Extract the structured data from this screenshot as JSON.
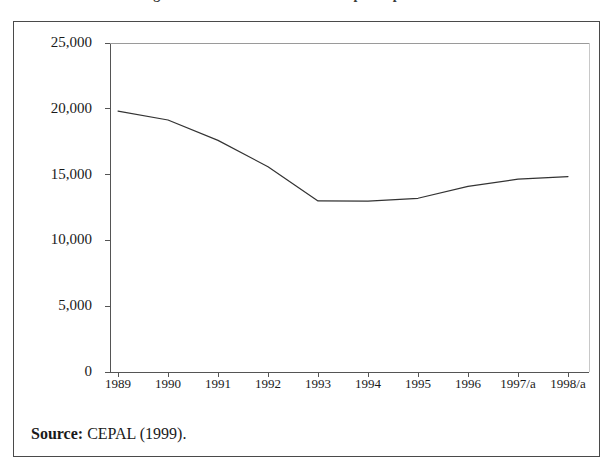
{
  "figure": {
    "title_remnant": "Figura 1. Producto interno bruto per cápita",
    "source_label": "Source:",
    "source_text": "CEPAL (1999)."
  },
  "chart_data": {
    "type": "line",
    "title": "",
    "xlabel": "",
    "ylabel": "",
    "categories": [
      "1989",
      "1990",
      "1991",
      "1992",
      "1993",
      "1994",
      "1995",
      "1996",
      "1997/a",
      "1998/a"
    ],
    "values": [
      19830,
      19150,
      17600,
      15600,
      13000,
      12980,
      13200,
      14100,
      14650,
      14850
    ],
    "series": [
      {
        "name": "GDP",
        "values": [
          19830,
          19150,
          17600,
          15600,
          13000,
          12980,
          13200,
          14100,
          14650,
          14850
        ]
      }
    ],
    "ylim": [
      0,
      25000
    ],
    "ytick_values": [
      25000,
      20000,
      15000,
      10000,
      5000,
      0
    ],
    "ytick_labels": [
      "25,000",
      "20,000",
      "15,000",
      "10,000",
      "5,000",
      "0"
    ],
    "xtick_labels": [
      "1989",
      "1990",
      "1991",
      "1992",
      "1993",
      "1994",
      "1995",
      "1996",
      "1997/a",
      "1998/a"
    ],
    "grid": false,
    "legend": null,
    "line_color": "#333333",
    "line_width": 1.2,
    "markers": false,
    "axis_color": "#555555",
    "background": "#ffffff"
  },
  "geometry": {
    "plot_left": 96,
    "plot_right": 575,
    "plot_top": 21,
    "plot_bottom": 350,
    "tick_start_x": 104,
    "tick_step_x": 50
  }
}
